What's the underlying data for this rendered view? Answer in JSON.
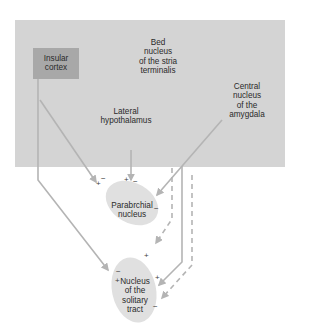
{
  "diagram": {
    "type": "neural-pathway",
    "colors": {
      "background": "#ffffff",
      "forebrain_region": "#d4d4d4",
      "insular_box": "#a8a8a8",
      "nucleus_fill": "#e0e0e0",
      "arrow": "#b4b4b4",
      "text": "#2a2a2a"
    },
    "nodes": {
      "insular_cortex": {
        "label": "Insular\ncortex"
      },
      "bed_nucleus": {
        "label": "Bed\nnucleus\nof the stria\nterminalis"
      },
      "lateral_hypothalamus": {
        "label": "Lateral\nhypothalamus"
      },
      "central_amygdala": {
        "label": "Central\nnucleus\nof the\namygdala"
      },
      "parabrachial": {
        "label": "Parabrchial\nnucleus"
      },
      "nts": {
        "label": "Nucleus\nof the\nsolitary\ntract"
      }
    },
    "signs": {
      "pb_top_left_plus": "+",
      "pb_top_left_minus": "−",
      "pb_top_mid_plus": "+",
      "pb_top_mid_minus": "−",
      "pb_right_minus": "−",
      "nts_top_plus": "+",
      "nts_left_minus": "−",
      "nts_left_plus": "+",
      "nts_right_plus": "+",
      "nts_right_minus": "−"
    },
    "connections": [
      {
        "from": "Insular cortex",
        "to": "Parabrchial nucleus",
        "style": "solid"
      },
      {
        "from": "Insular cortex",
        "to": "Nucleus of the solitary tract",
        "style": "solid"
      },
      {
        "from": "Lateral hypothalamus",
        "to": "Parabrchial nucleus",
        "style": "solid"
      },
      {
        "from": "Central nucleus of the amygdala",
        "to": "Parabrchial nucleus",
        "style": "solid"
      },
      {
        "from": "Bed nucleus of the stria terminalis",
        "to": "Nucleus of the solitary tract",
        "style": "dashed"
      },
      {
        "from": "Central nucleus of the amygdala",
        "to": "Nucleus of the solitary tract",
        "style": "solid"
      },
      {
        "from": "Forebrain",
        "to": "Nucleus of the solitary tract",
        "style": "dashed"
      }
    ]
  }
}
